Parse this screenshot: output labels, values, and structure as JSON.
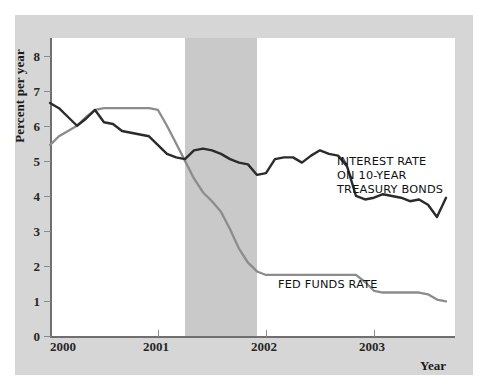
{
  "figure": {
    "width": 488,
    "height": 391,
    "panel_color": "#d6d6d6",
    "plot_background": "#ffffff"
  },
  "axes": {
    "y_title": "Percent per year",
    "x_title": "Year",
    "y_ticks": [
      "0",
      "1",
      "2",
      "3",
      "4",
      "5",
      "6",
      "7",
      "8"
    ],
    "x_ticks": [
      "2000",
      "2001",
      "2002",
      "2003"
    ]
  },
  "annotations": {
    "treasury_line_1": "INTEREST RATE",
    "treasury_line_2": "ON 10-YEAR",
    "treasury_line_3": "TREASURY BONDS",
    "fed_funds": "FED FUNDS RATE"
  },
  "chart_data": {
    "type": "line",
    "title": "",
    "xlabel": "Year",
    "ylabel": "Percent per year",
    "xlim": [
      2000.0,
      2003.75
    ],
    "ylim": [
      0,
      8.5
    ],
    "grid": false,
    "legend": "inline-annotations",
    "shaded_regions": [
      {
        "label": "recession",
        "x_start": 2001.25,
        "x_end": 2001.92,
        "color": "#c9c9c9"
      }
    ],
    "series": [
      {
        "name": "INTEREST RATE ON 10-YEAR TREASURY BONDS",
        "color": "#2b2b2b",
        "x": [
          2000.0,
          2000.083,
          2000.167,
          2000.25,
          2000.333,
          2000.417,
          2000.5,
          2000.583,
          2000.667,
          2000.75,
          2000.833,
          2000.917,
          2001.0,
          2001.083,
          2001.167,
          2001.25,
          2001.333,
          2001.417,
          2001.5,
          2001.583,
          2001.667,
          2001.75,
          2001.833,
          2001.917,
          2002.0,
          2002.083,
          2002.167,
          2002.25,
          2002.333,
          2002.417,
          2002.5,
          2002.583,
          2002.667,
          2002.75,
          2002.833,
          2002.917,
          2003.0,
          2003.083,
          2003.167,
          2003.25,
          2003.333,
          2003.417,
          2003.5,
          2003.583,
          2003.667
        ],
        "y": [
          6.65,
          6.5,
          6.25,
          6.0,
          6.2,
          6.45,
          6.1,
          6.05,
          5.85,
          5.8,
          5.75,
          5.7,
          5.45,
          5.2,
          5.1,
          5.05,
          5.3,
          5.35,
          5.3,
          5.2,
          5.05,
          4.95,
          4.9,
          4.6,
          4.65,
          5.05,
          5.1,
          5.1,
          4.95,
          5.15,
          5.3,
          5.2,
          5.15,
          4.85,
          4.0,
          3.9,
          3.95,
          4.05,
          4.0,
          3.95,
          3.85,
          3.9,
          3.75,
          3.4,
          3.95
        ]
      },
      {
        "name": "FED FUNDS RATE",
        "color": "#8c8c8c",
        "x": [
          2000.0,
          2000.083,
          2000.167,
          2000.25,
          2000.333,
          2000.417,
          2000.5,
          2000.583,
          2000.667,
          2000.75,
          2000.833,
          2000.917,
          2001.0,
          2001.083,
          2001.167,
          2001.25,
          2001.333,
          2001.417,
          2001.5,
          2001.583,
          2001.667,
          2001.75,
          2001.833,
          2001.917,
          2002.0,
          2002.25,
          2002.5,
          2002.75,
          2002.833,
          2002.917,
          2003.0,
          2003.083,
          2003.25,
          2003.417,
          2003.5,
          2003.583,
          2003.667
        ],
        "y": [
          5.45,
          5.7,
          5.85,
          6.0,
          6.25,
          6.45,
          6.5,
          6.5,
          6.5,
          6.5,
          6.5,
          6.5,
          6.45,
          6.0,
          5.5,
          5.0,
          4.5,
          4.1,
          3.85,
          3.55,
          3.05,
          2.5,
          2.1,
          1.85,
          1.75,
          1.75,
          1.75,
          1.75,
          1.75,
          1.55,
          1.3,
          1.25,
          1.25,
          1.25,
          1.2,
          1.05,
          1.0
        ]
      }
    ]
  }
}
